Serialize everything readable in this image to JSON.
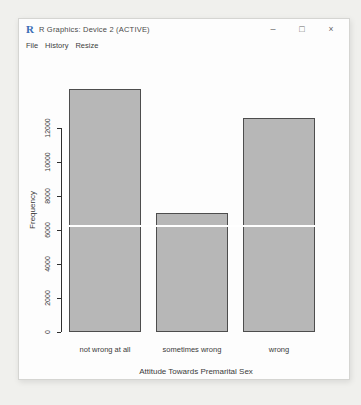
{
  "window": {
    "app_icon": "R",
    "title": "R Graphics: Device 2 (ACTIVE)",
    "menu": [
      {
        "label": "File"
      },
      {
        "label": "History"
      },
      {
        "label": "Resize"
      }
    ],
    "controls": {
      "minimize": "–",
      "maximize": "□",
      "close": "×"
    }
  },
  "chart_data": {
    "type": "bar",
    "title": "",
    "xlabel": "Attitude Towards Premarital Sex",
    "ylabel": "Frequency",
    "categories": [
      "not wrong at all",
      "sometimes wrong",
      "wrong"
    ],
    "values": [
      14300,
      7000,
      12600
    ],
    "ylim": [
      0,
      14300
    ],
    "yticks": [
      0,
      2000,
      4000,
      6000,
      8000,
      10000,
      12000
    ],
    "grid": false,
    "legend": "none",
    "bar_fill": "#b7b7b7",
    "bar_border": "#4d4d4d",
    "axis_color": "#2e2e2e",
    "overlay_line": {
      "value": 6300,
      "color": "#ffffff"
    }
  }
}
